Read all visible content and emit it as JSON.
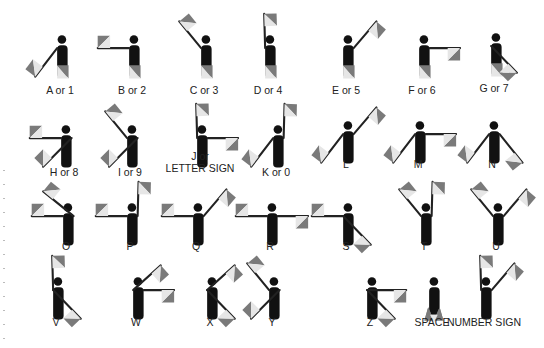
{
  "colors": {
    "body": "#111111",
    "flag_dark": "#7a7a7a",
    "flag_light": "#e6e6e6",
    "pole": "#222222",
    "text": "#222222"
  },
  "signals": [
    {
      "label": "A or 1",
      "x": 20,
      "y": 10,
      "ly": 84,
      "arms": [
        "down-left",
        "down"
      ]
    },
    {
      "label": "B or 2",
      "x": 92,
      "y": 10,
      "ly": 84,
      "arms": [
        "left",
        "down"
      ]
    },
    {
      "label": "C or 3",
      "x": 164,
      "y": 10,
      "ly": 84,
      "arms": [
        "up-left",
        "down"
      ]
    },
    {
      "label": "D or 4",
      "x": 228,
      "y": 10,
      "ly": 84,
      "arms": [
        "up",
        "down"
      ]
    },
    {
      "label": "E or 5",
      "x": 306,
      "y": 10,
      "ly": 84,
      "arms": [
        "down",
        "up-right"
      ]
    },
    {
      "label": "F or 6",
      "x": 382,
      "y": 10,
      "ly": 84,
      "arms": [
        "down",
        "right"
      ]
    },
    {
      "label": "G or 7",
      "x": 454,
      "y": 8,
      "ly": 82,
      "arms": [
        "down",
        "down-right-cross"
      ]
    },
    {
      "label": "H or 8",
      "x": 24,
      "y": 100,
      "ly": 166,
      "arms": [
        "left",
        "down-left-cross"
      ]
    },
    {
      "label": "I or 9",
      "x": 90,
      "y": 100,
      "ly": 166,
      "arms": [
        "up-left",
        "down-left-cross"
      ]
    },
    {
      "label": "J or\nLETTER SIGN",
      "x": 160,
      "y": 100,
      "ly": 150,
      "arms": [
        "up",
        "right"
      ]
    },
    {
      "label": "K or 0",
      "x": 236,
      "y": 100,
      "ly": 166,
      "arms": [
        "down-left",
        "up-right-vertical"
      ]
    },
    {
      "label": "L",
      "x": 306,
      "y": 96,
      "ly": 158,
      "arms": [
        "down-left",
        "up-right"
      ]
    },
    {
      "label": "M",
      "x": 378,
      "y": 96,
      "ly": 158,
      "arms": [
        "down-left",
        "right"
      ]
    },
    {
      "label": "N",
      "x": 452,
      "y": 96,
      "ly": 158,
      "arms": [
        "down-left",
        "down-right"
      ]
    },
    {
      "label": "O",
      "x": 26,
      "y": 178,
      "ly": 240,
      "arms": [
        "left",
        "up-left-cross"
      ]
    },
    {
      "label": "P",
      "x": 90,
      "y": 178,
      "ly": 240,
      "arms": [
        "left",
        "up-right-vertical"
      ]
    },
    {
      "label": "Q",
      "x": 156,
      "y": 178,
      "ly": 240,
      "arms": [
        "left",
        "up-right"
      ]
    },
    {
      "label": "R",
      "x": 230,
      "y": 178,
      "ly": 240,
      "arms": [
        "left",
        "right"
      ]
    },
    {
      "label": "S",
      "x": 306,
      "y": 178,
      "ly": 240,
      "arms": [
        "left",
        "down-right-cross-left"
      ]
    },
    {
      "label": "T",
      "x": 384,
      "y": 178,
      "ly": 240,
      "arms": [
        "up-left",
        "up-right-vertical"
      ]
    },
    {
      "label": "U",
      "x": 456,
      "y": 178,
      "ly": 240,
      "arms": [
        "up-left",
        "up-right"
      ]
    },
    {
      "label": "V",
      "x": 16,
      "y": 252,
      "ly": 316,
      "arms": [
        "up",
        "down-right-cross-left"
      ]
    },
    {
      "label": "W",
      "x": 96,
      "y": 252,
      "ly": 316,
      "arms": [
        "up-right-from-left",
        "right"
      ]
    },
    {
      "label": "X",
      "x": 170,
      "y": 252,
      "ly": 316,
      "arms": [
        "up-right-from-left",
        "down-right-cross-left"
      ]
    },
    {
      "label": "Y",
      "x": 232,
      "y": 252,
      "ly": 316,
      "arms": [
        "up-left",
        "down-left-cross"
      ]
    },
    {
      "label": "Z",
      "x": 330,
      "y": 252,
      "ly": 316,
      "arms": [
        "right-from-left",
        "down-right-cross-left"
      ]
    },
    {
      "label": "SPACE",
      "x": 392,
      "y": 252,
      "ly": 316,
      "arms": [
        "space",
        "space"
      ]
    },
    {
      "label": "NUMBER SIGN",
      "x": 444,
      "y": 252,
      "ly": 316,
      "arms": [
        "up",
        "up-right"
      ]
    }
  ]
}
